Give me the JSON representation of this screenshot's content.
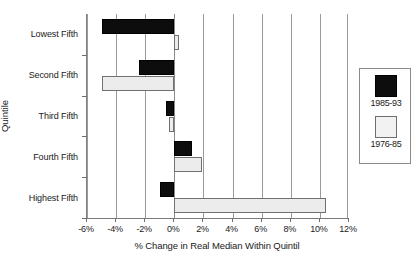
{
  "chart_data": {
    "type": "bar",
    "orientation": "horizontal",
    "title": "",
    "xlabel": "% Change in Real Median Within Quintil",
    "ylabel": "Quintile",
    "categories": [
      "Lowest Fifth",
      "Second Fifth",
      "Third Fifth",
      "Fourth Fifth",
      "Highest Fifth"
    ],
    "series": [
      {
        "name": "1985-93",
        "color": "#0d0d0d",
        "values": [
          -5.0,
          -2.4,
          -0.6,
          1.2,
          -1.0
        ]
      },
      {
        "name": "1976-85",
        "color": "#ececec",
        "values": [
          0.3,
          -5.0,
          -0.4,
          1.9,
          10.4
        ]
      }
    ],
    "xlim": [
      -6,
      12
    ],
    "xticks": [
      -6,
      -4,
      -2,
      0,
      2,
      4,
      6,
      8,
      10,
      12
    ],
    "xtick_labels": [
      "-6%",
      "-4%",
      "-2%",
      "0%",
      "2%",
      "4%",
      "6%",
      "8%",
      "10%",
      "12%"
    ],
    "grid": "vertical",
    "legend_position": "right-outside"
  },
  "axes": {
    "x_title": "% Change in Real Median Within Quintil",
    "y_title": "Quintile"
  },
  "legend": {
    "entries": [
      {
        "label": "1985-93"
      },
      {
        "label": "1976-85"
      }
    ]
  }
}
